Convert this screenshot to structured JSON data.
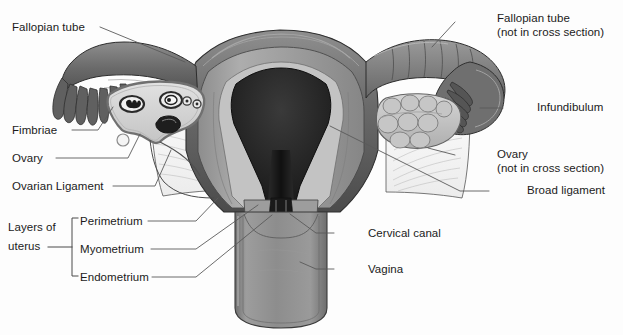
{
  "figure": {
    "width": 623,
    "height": 335,
    "background": "#fdfdfd"
  },
  "palette": {
    "ink": "#1b1b1b",
    "leader_line": "#5a5a5a",
    "tube_dark": "#6d6d6d",
    "tube_darker": "#4e4e4e",
    "cavity_black": "#151515",
    "myometrium": "#9a9a9a",
    "endometrium_pale": "#c9c9c9",
    "broad_ligament": "#f2f2f2",
    "vagina_gray": "#8d8d8d",
    "ovary_fill": "#d9d9d9",
    "ovary_rim": "#8f8f8f",
    "outline": "#3d3d3d"
  },
  "labels": {
    "left": [
      {
        "id": "fallopian-tube",
        "text": "Fallopian tube",
        "x": 12,
        "y": 21,
        "line": {
          "x1": 100,
          "y1": 27,
          "x2": 185,
          "y2": 62
        }
      },
      {
        "id": "fimbriae",
        "text": "Fimbriae",
        "x": 12,
        "y": 124,
        "line": {
          "x1": 72,
          "y1": 130,
          "x2": 98,
          "y2": 130
        }
      },
      {
        "id": "ovary",
        "text": "Ovary",
        "x": 12,
        "y": 152,
        "line": {
          "x1": 56,
          "y1": 158,
          "x2": 128,
          "y2": 158
        }
      },
      {
        "id": "ovarian-ligament",
        "text": "Ovarian Ligament",
        "x": 12,
        "y": 180,
        "line": {
          "x1": 113,
          "y1": 186,
          "x2": 155,
          "y2": 186
        }
      }
    ],
    "layers_group": {
      "id": "layers-of-uterus",
      "title_line1": "Layers of",
      "title_line2": "uterus",
      "title_x": 8,
      "title_y": 228,
      "bracket": {
        "x": 72,
        "y_top": 218,
        "y_bottom": 276,
        "tick": 6,
        "stem_x1": 48,
        "stem_x2": 72,
        "stem_y": 247
      },
      "items": [
        {
          "id": "perimetrium",
          "text": "Perimetrium",
          "x": 80,
          "y": 215,
          "line": {
            "x1": 148,
            "y1": 221,
            "x2": 196,
            "y2": 221
          }
        },
        {
          "id": "myometrium",
          "text": "Myometrium",
          "x": 80,
          "y": 243,
          "line": {
            "x1": 151,
            "y1": 249,
            "x2": 196,
            "y2": 249
          }
        },
        {
          "id": "endometrium",
          "text": "Endometrium",
          "x": 80,
          "y": 271,
          "line": {
            "x1": 152,
            "y1": 277,
            "x2": 196,
            "y2": 277
          }
        }
      ]
    },
    "right": [
      {
        "id": "fallopian-tube-not-cross",
        "text": "Fallopian tube",
        "sub": "(not in cross section)",
        "x": 497,
        "y": 12,
        "line": {
          "x1": 455,
          "y1": 22,
          "x2": 432,
          "y2": 47
        }
      },
      {
        "id": "infundibulum",
        "text": "Infundibulum",
        "sub": null,
        "x": 537,
        "y": 101,
        "line": {
          "x1": 503,
          "y1": 108,
          "x2": 492,
          "y2": 108
        }
      },
      {
        "id": "ovary-not-cross",
        "text": "Ovary",
        "sub": "(not in cross section)",
        "x": 497,
        "y": 148,
        "line": {
          "x1": 455,
          "y1": 155,
          "x2": 446,
          "y2": 152
        }
      },
      {
        "id": "broad-ligament",
        "text": "Broad ligament",
        "sub": null,
        "x": 527,
        "y": 184,
        "line": {
          "x1": 489,
          "y1": 191,
          "x2": 460,
          "y2": 191
        }
      },
      {
        "id": "cervical-canal",
        "text": "Cervical canal",
        "sub": null,
        "x": 368,
        "y": 227,
        "line": {
          "x1": 334,
          "y1": 233,
          "x2": 316,
          "y2": 233
        }
      },
      {
        "id": "vagina",
        "text": "Vagina",
        "sub": null,
        "x": 368,
        "y": 263,
        "line": {
          "x1": 334,
          "y1": 269,
          "x2": 316,
          "y2": 269
        }
      }
    ]
  },
  "anatomy_parts": [
    "uterine-fundus",
    "uterine-body",
    "uterine-cavity",
    "myometrium-wall",
    "endometrium-lining",
    "perimetrium-serosa",
    "cervix",
    "cervical-canal",
    "vagina",
    "left-fallopian-tube",
    "left-fimbriae",
    "left-ovary-cross-section",
    "ovarian-follicles",
    "corpus-luteum",
    "ovarian-ligament",
    "right-fallopian-tube",
    "right-infundibulum",
    "right-fimbriae",
    "right-ovary-surface",
    "broad-ligament-left",
    "broad-ligament-right"
  ]
}
